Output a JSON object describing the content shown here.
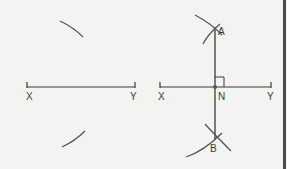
{
  "diagram": {
    "panels": [
      {
        "name": "step-1-arcs",
        "segment": {
          "start_label": "X",
          "end_label": "Y"
        },
        "arcs": [
          "upper-arc",
          "lower-arc"
        ]
      },
      {
        "name": "step-2-bisector",
        "segment": {
          "start_label": "X",
          "end_label": "Y"
        },
        "points": {
          "top": "A",
          "bottom": "B",
          "midpoint": "N"
        },
        "right_angle_at": "N"
      }
    ],
    "colors": {
      "background": "#f3f3f1",
      "line": "#3a3a3a",
      "arc": "#555555",
      "border": "#4a4a4a"
    }
  }
}
